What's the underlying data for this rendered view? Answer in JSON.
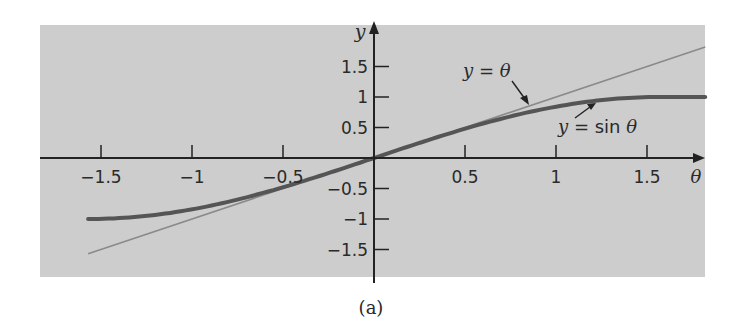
{
  "figure": {
    "caption": "(a)",
    "background_color": "#cdcdcd",
    "axis_color": "#222222",
    "sin_curve_color": "#555555",
    "line_color": "#8a8a8a"
  },
  "chart_data": {
    "type": "line",
    "title": "",
    "xlabel": "θ",
    "ylabel": "y",
    "xlim": [
      -1.8,
      1.82
    ],
    "ylim": [
      -2.0,
      2.2
    ],
    "grid": false,
    "x_ticks": [
      -1.5,
      -1,
      -0.5,
      0.5,
      1,
      1.5
    ],
    "x_tick_labels": [
      "−1.5",
      "−1",
      "−0.5",
      "0.5",
      "1",
      "1.5"
    ],
    "y_ticks": [
      1.5,
      1,
      0.5,
      -0.5,
      -1,
      -1.5
    ],
    "y_tick_labels": [
      "1.5",
      "1",
      "0.5",
      "−0.5",
      "−1",
      "−1.5"
    ],
    "series": [
      {
        "name": "y = θ",
        "style": "thin line",
        "x": [
          -1.5708,
          -1.0,
          -0.5,
          0,
          0.5,
          1.0,
          1.5,
          1.82
        ],
        "y": [
          -1.5708,
          -1.0,
          -0.5,
          0,
          0.5,
          1.0,
          1.5,
          1.82
        ]
      },
      {
        "name": "y = sin θ",
        "style": "thick curve",
        "x": [
          -1.5708,
          -1.25,
          -1.0,
          -0.75,
          -0.5,
          -0.25,
          0,
          0.25,
          0.5,
          0.75,
          1.0,
          1.25,
          1.5708,
          1.82
        ],
        "y": [
          -1.0,
          -0.949,
          -0.841,
          -0.682,
          -0.479,
          -0.247,
          0,
          0.247,
          0.479,
          0.682,
          0.841,
          0.949,
          1.0,
          1.0
        ]
      }
    ],
    "annotations": [
      {
        "text": "y = θ",
        "points_to": [
          0.78,
          0.78
        ]
      },
      {
        "text": "y = sin θ",
        "points_to": [
          1.2,
          0.93
        ]
      }
    ]
  }
}
